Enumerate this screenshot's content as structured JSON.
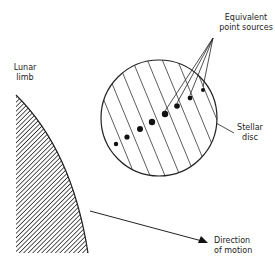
{
  "diagram": {
    "type": "lunar occultation schematic",
    "labels": {
      "equivalent_point_sources_1": "Equivalent",
      "equivalent_point_sources_2": "point sources",
      "lunar_limb_1": "Lunar",
      "lunar_limb_2": "limb",
      "stellar_disc_1": "Stellar",
      "stellar_disc_2": "disc",
      "direction_1": "Direction",
      "direction_2": "of motion"
    },
    "colors": {
      "ink": "#222222",
      "background": "#ffffff"
    },
    "stellar_disc": {
      "cx": 159,
      "cy": 118,
      "r": 58
    },
    "point_sources": [
      {
        "x": 116,
        "y": 144,
        "r": 2.2
      },
      {
        "x": 127,
        "y": 137,
        "r": 2.6
      },
      {
        "x": 140,
        "y": 129,
        "r": 3.0
      },
      {
        "x": 152,
        "y": 122,
        "r": 3.2
      },
      {
        "x": 165,
        "y": 114,
        "r": 3.2
      },
      {
        "x": 177,
        "y": 106,
        "r": 2.8
      },
      {
        "x": 190,
        "y": 98,
        "r": 2.4
      },
      {
        "x": 203,
        "y": 90,
        "r": 2.0
      }
    ],
    "pointer_apex": {
      "x": 213,
      "y": 38
    },
    "motion_arrow": {
      "x1": 90,
      "y1": 211,
      "x2": 207,
      "y2": 242
    }
  }
}
